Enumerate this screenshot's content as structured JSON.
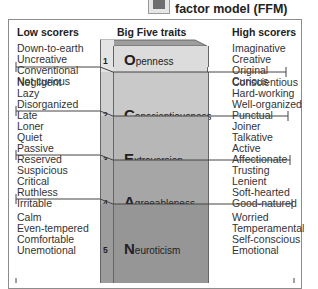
{
  "header": {
    "title": "factor model (FFM)",
    "icon": "model-icon"
  },
  "columns": {
    "low": "Low scorers",
    "traits": "Big Five traits",
    "high": "High scorers"
  },
  "traits": [
    {
      "number": "1",
      "initial": "O",
      "rest": "penness",
      "low": [
        "Down-to-earth",
        "Uncreative",
        "Conventional",
        "Not curious"
      ],
      "high": [
        "Imaginative",
        "Creative",
        "Original",
        "Curious"
      ],
      "color": "#dcdcdc"
    },
    {
      "number": "2",
      "initial": "C",
      "rest": "onscientiousness",
      "low": [
        "Negligent",
        "Lazy",
        "Disorganized",
        "Late"
      ],
      "high": [
        "Conscientious",
        "Hard-working",
        "Well-organized",
        "Punctual"
      ],
      "color": "#c9c9c9"
    },
    {
      "number": "3",
      "initial": "E",
      "rest": "xtroversion",
      "low": [
        "Loner",
        "Quiet",
        "Passive",
        "Reserved"
      ],
      "high": [
        "Joiner",
        "Talkative",
        "Active",
        "Affectionate"
      ],
      "color": "#b7b7b7"
    },
    {
      "number": "4",
      "initial": "A",
      "rest": "greeableness",
      "low": [
        "Suspicious",
        "Critical",
        "Ruthless",
        "Irritable"
      ],
      "high": [
        "Trusting",
        "Lenient",
        "Soft-hearted",
        "Good-natured"
      ],
      "color": "#a6a6a6"
    },
    {
      "number": "5",
      "initial": "N",
      "rest": "euroticism",
      "low": [
        "Calm",
        "Even-tempered",
        "Comfortable",
        "Unemotional"
      ],
      "high": [
        "Worried",
        "Temperamental",
        "Self-conscious",
        "Emotional"
      ],
      "color": "#969696"
    }
  ]
}
